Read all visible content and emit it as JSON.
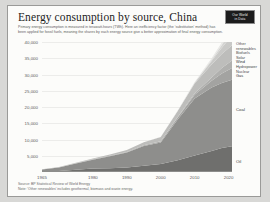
{
  "card": {
    "title": "Energy consumption by source, China",
    "subtitle": "Primary energy consumption is measured in terawatt-hours (TWh). Here an inefficiency factor (the 'substitution' method) has been applied for fossil fuels, meaning the shares by each energy source give a better approximation of final energy consumption.",
    "logo_line1": "Our World",
    "logo_line2": "in Data",
    "source_line": "Source: BP Statistical Review of World Energy",
    "note_line": "Note: 'Other renewables' includes geothermal, biomass and waste energy."
  },
  "legend": {
    "top_items": [
      "Other",
      "renewables",
      "Biofuels",
      "Solar",
      "Wind",
      "Hydropower",
      "Nuclear",
      "Gas"
    ],
    "coal_label": "Coal",
    "oil_label": "Oil"
  },
  "chart_data": {
    "type": "area",
    "title": "Energy consumption by source, China",
    "xlabel": "",
    "ylabel": "TWh",
    "xlim": [
      1965,
      2021
    ],
    "ylim": [
      0,
      40000
    ],
    "grid": true,
    "legend_position": "right",
    "xticks": [
      "1965",
      "1980",
      "1990",
      "2000",
      "2010",
      "2020"
    ],
    "xtick_values": [
      1965,
      1980,
      1990,
      2000,
      2010,
      2020
    ],
    "yticks": [
      "5,000",
      "10,000",
      "15,000",
      "20,000",
      "25,000",
      "30,000",
      "35,000",
      "40,000"
    ],
    "ytick_values": [
      5000,
      10000,
      15000,
      20000,
      25000,
      30000,
      35000,
      40000
    ],
    "x": [
      1965,
      1970,
      1975,
      1980,
      1985,
      1990,
      1995,
      2000,
      2005,
      2010,
      2015,
      2018,
      2021
    ],
    "series": [
      {
        "name": "Oil",
        "color": "#6f6f6d",
        "values": [
          120,
          320,
          700,
          1050,
          1150,
          1400,
          1900,
          2450,
          3650,
          5100,
          6500,
          7400,
          7900
        ]
      },
      {
        "name": "Coal",
        "color": "#8e8e8c",
        "values": [
          650,
          1100,
          1900,
          2700,
          3700,
          4600,
          6100,
          6600,
          12500,
          17500,
          19500,
          20000,
          20500
        ]
      },
      {
        "name": "Gas",
        "color": "#a3a3a1",
        "values": [
          10,
          30,
          90,
          140,
          160,
          190,
          220,
          320,
          620,
          1200,
          2100,
          2900,
          3600
        ]
      },
      {
        "name": "Nuclear",
        "color": "#b0b0ae",
        "values": [
          0,
          0,
          0,
          0,
          0,
          0,
          40,
          100,
          180,
          400,
          980,
          1700,
          2300
        ]
      },
      {
        "name": "Hydropower",
        "color": "#bdbdbb",
        "values": [
          30,
          60,
          140,
          250,
          400,
          600,
          900,
          1300,
          1800,
          3000,
          4000,
          4300,
          4700
        ]
      },
      {
        "name": "Wind",
        "color": "#c9c9c7",
        "values": [
          0,
          0,
          0,
          0,
          0,
          0,
          0,
          10,
          40,
          250,
          1100,
          1900,
          3000
        ]
      },
      {
        "name": "Solar",
        "color": "#d4d4d2",
        "values": [
          0,
          0,
          0,
          0,
          0,
          0,
          0,
          0,
          5,
          20,
          300,
          900,
          1800
        ]
      },
      {
        "name": "Biofuels",
        "color": "#dedede",
        "values": [
          0,
          0,
          0,
          0,
          0,
          0,
          0,
          10,
          30,
          80,
          150,
          200,
          240
        ]
      },
      {
        "name": "Other renewables",
        "color": "#e6e6e4",
        "values": [
          0,
          0,
          0,
          0,
          0,
          10,
          20,
          40,
          90,
          180,
          380,
          550,
          700
        ]
      }
    ]
  }
}
